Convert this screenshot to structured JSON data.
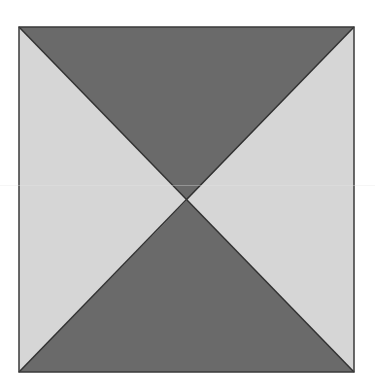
{
  "diagram": {
    "type": "square-divided-by-diagonals",
    "canvas": {
      "width": 375,
      "height": 392
    },
    "square": {
      "x": 19,
      "y": 27,
      "width": 335,
      "height": 345
    },
    "center": {
      "x": 187,
      "y": 200
    },
    "colors": {
      "dark_fill": "#6a6a6a",
      "light_fill": "#d6d6d6",
      "stroke": "#333333",
      "background": "#ffffff"
    },
    "regions": [
      {
        "name": "top-triangle",
        "shade": "dark"
      },
      {
        "name": "bottom-triangle",
        "shade": "dark"
      },
      {
        "name": "left-triangle",
        "shade": "light"
      },
      {
        "name": "right-triangle",
        "shade": "light"
      }
    ]
  }
}
